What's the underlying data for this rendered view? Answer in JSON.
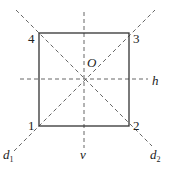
{
  "diagram": {
    "vertices": [
      {
        "label": "1",
        "x": 39,
        "y": 126
      },
      {
        "label": "2",
        "x": 129,
        "y": 126
      },
      {
        "label": "3",
        "x": 129,
        "y": 33
      },
      {
        "label": "4",
        "x": 39,
        "y": 33
      }
    ],
    "center": {
      "label": "O",
      "x": 84,
      "y": 79
    },
    "axes": {
      "h": "h",
      "v": "v",
      "d1": "d",
      "d1_sub": "1",
      "d2": "d",
      "d2_sub": "2"
    },
    "colors": {
      "stroke": "#333333",
      "dash": "#555555"
    }
  }
}
